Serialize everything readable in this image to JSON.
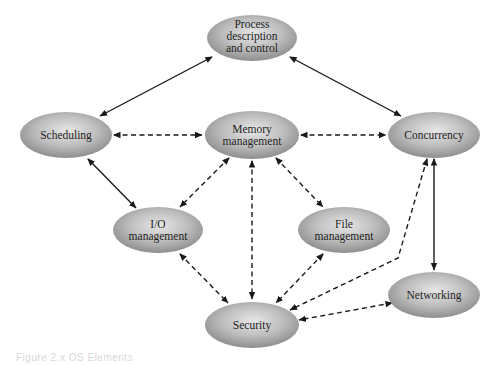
{
  "diagram": {
    "nodes": [
      {
        "id": "process",
        "label_lines": [
          "Process",
          "description",
          "and control"
        ],
        "cx": 252,
        "cy": 38,
        "rx": 45,
        "ry": 23
      },
      {
        "id": "scheduling",
        "label_lines": [
          "Scheduling"
        ],
        "cx": 66,
        "cy": 135,
        "rx": 46,
        "ry": 23
      },
      {
        "id": "memory",
        "label_lines": [
          "Memory",
          "management"
        ],
        "cx": 252,
        "cy": 135,
        "rx": 47,
        "ry": 24
      },
      {
        "id": "concurrency",
        "label_lines": [
          "Concurrency"
        ],
        "cx": 434,
        "cy": 135,
        "rx": 46,
        "ry": 23
      },
      {
        "id": "io",
        "label_lines": [
          "I/O",
          "management"
        ],
        "cx": 158,
        "cy": 230,
        "rx": 45,
        "ry": 23
      },
      {
        "id": "file",
        "label_lines": [
          "File",
          "management"
        ],
        "cx": 344,
        "cy": 230,
        "rx": 46,
        "ry": 23
      },
      {
        "id": "networking",
        "label_lines": [
          "Networking"
        ],
        "cx": 434,
        "cy": 295,
        "rx": 46,
        "ry": 23
      },
      {
        "id": "security",
        "label_lines": [
          "Security"
        ],
        "cx": 252,
        "cy": 325,
        "rx": 47,
        "ry": 23
      }
    ],
    "edges": [
      {
        "from": "process",
        "to": "scheduling",
        "style": "solid",
        "bidirectional": true
      },
      {
        "from": "process",
        "to": "concurrency",
        "style": "solid",
        "bidirectional": true
      },
      {
        "from": "scheduling",
        "to": "io",
        "style": "solid",
        "bidirectional": true
      },
      {
        "from": "concurrency",
        "to": "networking",
        "style": "solid",
        "bidirectional": true
      },
      {
        "from": "scheduling",
        "to": "memory",
        "style": "dashed",
        "bidirectional": true
      },
      {
        "from": "memory",
        "to": "concurrency",
        "style": "dashed",
        "bidirectional": true
      },
      {
        "from": "memory",
        "to": "io",
        "style": "dashed",
        "bidirectional": true
      },
      {
        "from": "memory",
        "to": "file",
        "style": "dashed",
        "bidirectional": true
      },
      {
        "from": "memory",
        "to": "security",
        "style": "dashed",
        "bidirectional": true
      },
      {
        "from": "io",
        "to": "security",
        "style": "dashed",
        "bidirectional": true
      },
      {
        "from": "file",
        "to": "security",
        "style": "dashed",
        "bidirectional": true
      },
      {
        "from": "concurrency",
        "to": "security",
        "style": "dashed",
        "bidirectional": true
      },
      {
        "from": "networking",
        "to": "security",
        "style": "dashed",
        "bidirectional": true
      }
    ],
    "colors": {
      "node_fill_light": "#e4e4e4",
      "node_fill_dark": "#8a8a8a",
      "edge": "#1a1a1a",
      "label": "#1e1e1e"
    }
  },
  "caption": "Figure 2.x  OS Elements"
}
